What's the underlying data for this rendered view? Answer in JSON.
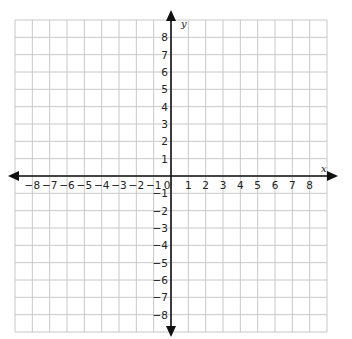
{
  "chart_data": {
    "type": "scatter",
    "title": "",
    "xlabel": "x",
    "ylabel": "y",
    "xlim": [
      -9,
      9
    ],
    "ylim": [
      -9,
      9
    ],
    "grid": true,
    "x_ticks": [
      -8,
      -7,
      -6,
      -5,
      -4,
      -3,
      -2,
      -1,
      0,
      1,
      2,
      3,
      4,
      5,
      6,
      7,
      8
    ],
    "y_ticks": [
      8,
      7,
      6,
      5,
      4,
      3,
      2,
      1,
      -1,
      -2,
      -3,
      -4,
      -5,
      -6,
      -7,
      -8
    ],
    "x_tick_labels": [
      "−8",
      "−7",
      "−6",
      "−5",
      "−4",
      "−3",
      "−2",
      "−1",
      "0",
      "1",
      "2",
      "3",
      "4",
      "5",
      "6",
      "7",
      "8"
    ],
    "y_tick_labels": [
      "8",
      "7",
      "6",
      "5",
      "4",
      "3",
      "2",
      "1",
      "−1",
      "−2",
      "−3",
      "−4",
      "−5",
      "−6",
      "−7",
      "−8"
    ],
    "series": [],
    "legend": null
  },
  "colors": {
    "grid": "#c8c8c8",
    "axis": "#111111",
    "background": "#ffffff"
  }
}
